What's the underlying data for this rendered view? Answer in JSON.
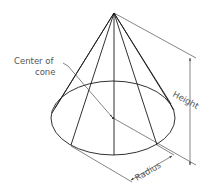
{
  "diagram": {
    "labels": {
      "center_line1": "Center of",
      "center_line2": "cone",
      "height": "Height",
      "radius": "Radius"
    },
    "colors": {
      "line": "#1a1a1a",
      "text": "#555555",
      "background": "#ffffff"
    },
    "geometry": {
      "apex": [
        114,
        13
      ],
      "base_center": [
        113,
        118
      ],
      "base_rx": 62,
      "base_ry": 37
    }
  }
}
